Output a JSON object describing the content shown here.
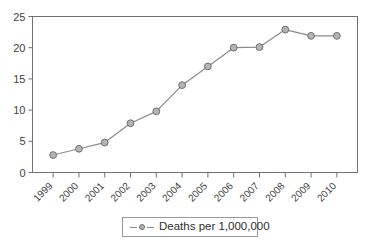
{
  "chart_data": {
    "type": "line",
    "title": "",
    "xlabel": "",
    "ylabel": "",
    "categories": [
      "1999",
      "2000",
      "2001",
      "2002",
      "2003",
      "2004",
      "2005",
      "2006",
      "2007",
      "2008",
      "2009",
      "2010"
    ],
    "series": [
      {
        "name": "Deaths per 1,000,000",
        "values": [
          2.8,
          3.8,
          4.8,
          7.9,
          9.8,
          14.0,
          17.0,
          20.0,
          20.1,
          22.9,
          21.9,
          21.9
        ]
      }
    ],
    "ylim": [
      0,
      25
    ],
    "yticks": [
      0,
      5,
      10,
      15,
      20,
      25
    ],
    "ytick_labels": [
      "0",
      "5",
      "10",
      "15",
      "20",
      "25"
    ],
    "grid": false,
    "legend_position": "bottom-center",
    "xtick_rotation": -45,
    "colors": {
      "line": "#8a8a8a",
      "marker_fill": "#b4b4b4",
      "marker_edge": "#6e6e6e",
      "axis": "#707070",
      "text": "#3f3f3f",
      "background": "#ffffff"
    }
  },
  "legend": {
    "entries": [
      {
        "label": "Deaths per 1,000,000",
        "marker": "circle-marker-icon"
      }
    ]
  }
}
